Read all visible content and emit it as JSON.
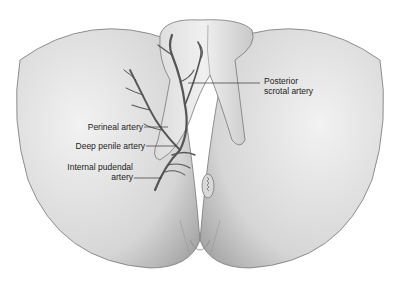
{
  "diagram": {
    "labels": {
      "posterior_scrotal_line1": "Posterior",
      "posterior_scrotal_line2": "scrotal artery",
      "perineal": "Perineal artery",
      "deep_penile": "Deep penile artery",
      "internal_pudendal_line1": "Internal pudendal",
      "internal_pudendal_line2": "artery"
    },
    "colors": {
      "skin_light": "#eeeeee",
      "skin_mid": "#cfcfcf",
      "skin_dark": "#9a9a9a",
      "artery": "#555555",
      "leader_line": "#333333",
      "background": "#ffffff"
    }
  }
}
